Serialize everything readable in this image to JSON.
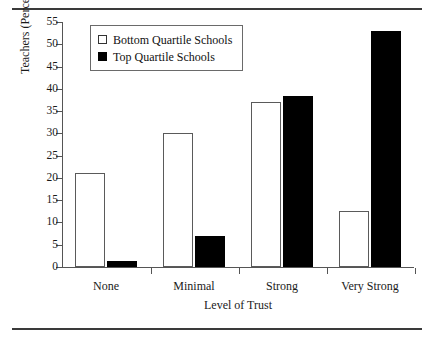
{
  "chart_data": {
    "type": "bar",
    "title": "",
    "xlabel": "Level of Trust",
    "ylabel": "Teachers (Percentage)",
    "categories": [
      "None",
      "Minimal",
      "Strong",
      "Very Strong"
    ],
    "series": [
      {
        "name": "Bottom Quartile Schools",
        "values": [
          21,
          30,
          37,
          12.5
        ],
        "fill": "#ffffff",
        "stroke": "#5a5a5a"
      },
      {
        "name": "Top Quartile Schools",
        "values": [
          1.3,
          7,
          38.5,
          53
        ],
        "fill": "#000000",
        "stroke": "#000000"
      }
    ],
    "ylim": [
      0,
      55
    ],
    "ytick_step": 5,
    "yticks": [
      0,
      5,
      10,
      15,
      20,
      25,
      30,
      35,
      40,
      45,
      50,
      55
    ],
    "ytick_labels": [
      "0",
      "5",
      "10",
      "15",
      "20",
      "25",
      "30",
      "35",
      "40",
      "45",
      "50",
      "55"
    ],
    "grid": false,
    "legend_position": "top-left-inside"
  },
  "legend": {
    "entries": [
      {
        "label": "Bottom Quartile Schools",
        "marker": "open-square-icon"
      },
      {
        "label": "Top Quartile Schools",
        "marker": "filled-square-icon"
      }
    ]
  }
}
